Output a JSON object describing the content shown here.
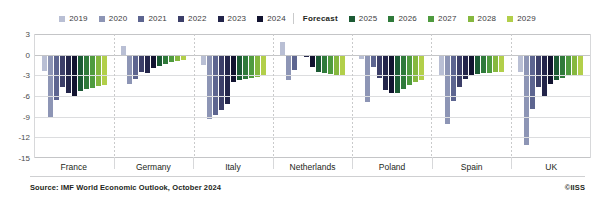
{
  "legend": {
    "history": [
      {
        "label": "2019",
        "color": "#b9bfd4"
      },
      {
        "label": "2020",
        "color": "#8d95b5"
      },
      {
        "label": "2021",
        "color": "#5d6590"
      },
      {
        "label": "2022",
        "color": "#3c3f69"
      },
      {
        "label": "2023",
        "color": "#23254a"
      },
      {
        "label": "2024",
        "color": "#121330"
      }
    ],
    "forecast_word": "Forecast",
    "forecast": [
      {
        "label": "2025",
        "color": "#1c5a34"
      },
      {
        "label": "2026",
        "color": "#2f7a3a"
      },
      {
        "label": "2027",
        "color": "#4f9b3f"
      },
      {
        "label": "2028",
        "color": "#86b83f"
      },
      {
        "label": "2029",
        "color": "#b2cf4a"
      }
    ]
  },
  "axis": {
    "ticks": [
      "3",
      "0",
      "-3",
      "-6",
      "-9",
      "-12",
      "-15"
    ],
    "min": -15,
    "max": 3
  },
  "footer": {
    "source": "Source: IMF World Economic Outlook, October 2024",
    "credit": "©IISS"
  },
  "chart_data": {
    "type": "bar",
    "title": "",
    "subtitle": "",
    "xlabel": "",
    "ylabel": "",
    "ylim": [
      -15,
      3
    ],
    "yticks": [
      3,
      0,
      -3,
      -6,
      -9,
      -12,
      -15
    ],
    "grid": true,
    "legend_position": "top-center",
    "categories": [
      "France",
      "Germany",
      "Italy",
      "Netherlands",
      "Poland",
      "Spain",
      "UK"
    ],
    "series": [
      {
        "name": "2019",
        "color": "#b9bfd4",
        "values": [
          -2.4,
          1.3,
          -1.5,
          1.8,
          -0.7,
          -3.1,
          -2.5
        ]
      },
      {
        "name": "2020",
        "color": "#8d95b5",
        "values": [
          -9.0,
          -4.3,
          -9.4,
          -3.7,
          -6.9,
          -10.1,
          -13.1
        ]
      },
      {
        "name": "2021",
        "color": "#5d6590",
        "values": [
          -6.6,
          -3.6,
          -8.7,
          -2.2,
          -1.8,
          -6.7,
          -7.9
        ]
      },
      {
        "name": "2022",
        "color": "#3c3f69",
        "values": [
          -4.7,
          -2.5,
          -8.1,
          -0.1,
          -3.4,
          -4.7,
          -4.7
        ]
      },
      {
        "name": "2023",
        "color": "#23254a",
        "values": [
          -5.5,
          -2.6,
          -7.2,
          -0.4,
          -5.1,
          -3.5,
          -6.0
        ]
      },
      {
        "name": "2024",
        "color": "#121330",
        "values": [
          -6.0,
          -2.0,
          -4.0,
          -1.8,
          -5.6,
          -3.0,
          -4.3
        ]
      },
      {
        "name": "2025",
        "color": "#1c5a34",
        "values": [
          -5.3,
          -1.6,
          -3.7,
          -2.5,
          -5.5,
          -2.8,
          -3.7
        ]
      },
      {
        "name": "2026",
        "color": "#2f7a3a",
        "values": [
          -5.0,
          -1.3,
          -3.6,
          -2.6,
          -5.0,
          -2.7,
          -3.4
        ]
      },
      {
        "name": "2027",
        "color": "#4f9b3f",
        "values": [
          -4.8,
          -1.1,
          -3.4,
          -2.8,
          -4.4,
          -2.6,
          -3.1
        ]
      },
      {
        "name": "2028",
        "color": "#86b83f",
        "values": [
          -4.6,
          -0.9,
          -3.2,
          -2.9,
          -4.0,
          -2.5,
          -3.0
        ]
      },
      {
        "name": "2029",
        "color": "#b2cf4a",
        "values": [
          -4.4,
          -0.8,
          -3.0,
          -3.0,
          -3.7,
          -2.5,
          -2.9
        ]
      }
    ]
  }
}
